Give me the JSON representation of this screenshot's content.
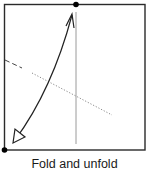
{
  "diagram": {
    "type": "origami-step",
    "caption": "Fold and unfold",
    "colors": {
      "outline": "#2a2a2a",
      "crease": "#9a9a9a",
      "arrow": "#222222",
      "dot": "#000000",
      "background": "#ffffff"
    },
    "elements": [
      {
        "kind": "square",
        "name": "paper-square"
      },
      {
        "kind": "dot",
        "name": "top-center-point"
      },
      {
        "kind": "dot",
        "name": "bottom-left-corner-point"
      },
      {
        "kind": "line",
        "style": "solid-thin",
        "name": "vertical-center-crease"
      },
      {
        "kind": "line",
        "style": "dashed",
        "name": "valley-fold-line"
      },
      {
        "kind": "line",
        "style": "dotted",
        "name": "fold-line-projection"
      },
      {
        "kind": "arrow",
        "style": "curved-double-headed",
        "name": "fold-unfold-arrow"
      }
    ]
  }
}
